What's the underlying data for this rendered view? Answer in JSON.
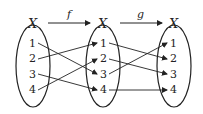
{
  "diagram": {
    "sets": [
      {
        "label": "X",
        "elements": [
          "1",
          "2",
          "3",
          "4"
        ]
      },
      {
        "label": "X",
        "elements": [
          "1",
          "2",
          "3",
          "4"
        ]
      },
      {
        "label": "X",
        "elements": [
          "1",
          "2",
          "3",
          "4"
        ]
      }
    ],
    "functions": [
      {
        "name": "f",
        "from": 0,
        "to": 1,
        "mapping": {
          "1": "3",
          "2": "1",
          "3": "4",
          "4": "2"
        }
      },
      {
        "name": "g",
        "from": 1,
        "to": 2,
        "mapping": {
          "1": "2",
          "2": "3",
          "3": "1",
          "4": "4"
        }
      }
    ],
    "colors": {
      "stroke": "#222222",
      "background": "#ffffff"
    }
  }
}
